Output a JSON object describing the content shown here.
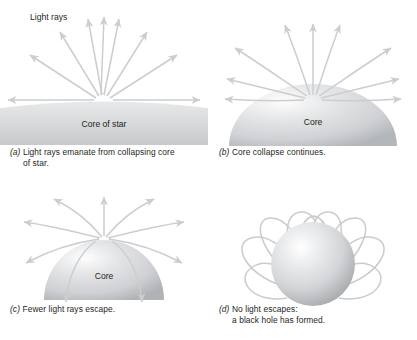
{
  "figure": {
    "panel_count": 4,
    "colors": {
      "ray_stroke": "#c9cbcd",
      "core_light": "#ffffff",
      "core_mid": "#dcdddf",
      "core_dark": "#a9acaf",
      "text": "#231f20",
      "background": "#ffffff"
    }
  },
  "panels": {
    "a": {
      "letter": "(a)",
      "caption_line1": "Light rays emanate from collapsing core",
      "caption_line2": "of star.",
      "rays_label": "Light rays",
      "core_label": "Core of star",
      "ray_count": 9,
      "ray_style": "straight",
      "core_shape": "wide shallow arc"
    },
    "b": {
      "letter": "(b)",
      "caption_line1": "Core collapse continues.",
      "caption_line2": "",
      "core_label": "Core",
      "ray_count": 9,
      "ray_style": "gently curved",
      "core_shape": "wide dome"
    },
    "c": {
      "letter": "(c)",
      "caption_line1": "Fewer light rays escape.",
      "caption_line2": "",
      "core_label": "Core",
      "ray_count": 9,
      "ray_style": "strongly curved",
      "core_shape": "half dome"
    },
    "d": {
      "letter": "(d)",
      "caption_line1": "No light escapes:",
      "caption_line2": "a black hole has formed.",
      "core_label": "",
      "ray_count": 8,
      "ray_style": "looping back inward",
      "core_shape": "sphere"
    }
  }
}
